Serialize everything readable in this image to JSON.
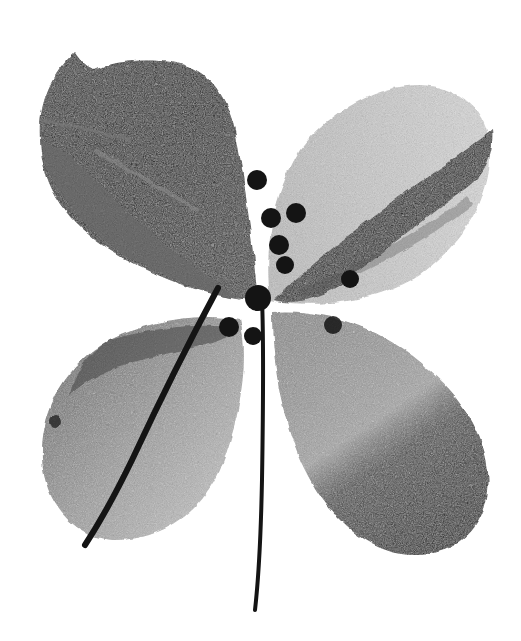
{
  "image": {
    "subject": "Monochrome print of a four-petaled flower with two thin stems and a cluster of dark seed dots at the center",
    "width": 521,
    "height": 641,
    "background": "#ffffff"
  },
  "colors": {
    "ink_dark": "#141414",
    "ink_mid": "#4a4a4a",
    "ink_light": "#9a9a9a",
    "paper": "#ffffff"
  },
  "petals": [
    {
      "name": "upper-left",
      "tone": "dark",
      "cx": 150,
      "cy": 170
    },
    {
      "name": "upper-right",
      "tone": "light with dark diagonal band",
      "cx": 385,
      "cy": 190
    },
    {
      "name": "lower-left",
      "tone": "mottled light-mid",
      "cx": 140,
      "cy": 430
    },
    {
      "name": "lower-right",
      "tone": "light fading to dark tip",
      "cx": 385,
      "cy": 440
    }
  ],
  "stems": [
    {
      "name": "diagonal-stem",
      "from": [
        215,
        290
      ],
      "to": [
        85,
        545
      ]
    },
    {
      "name": "vertical-stem",
      "from": [
        262,
        300
      ],
      "to": [
        255,
        610
      ]
    }
  ],
  "dots": [
    {
      "x": 257,
      "y": 180,
      "r": 10
    },
    {
      "x": 271,
      "y": 218,
      "r": 10
    },
    {
      "x": 296,
      "y": 213,
      "r": 10
    },
    {
      "x": 279,
      "y": 245,
      "r": 10
    },
    {
      "x": 285,
      "y": 265,
      "r": 9
    },
    {
      "x": 350,
      "y": 279,
      "r": 9
    },
    {
      "x": 229,
      "y": 327,
      "r": 10
    },
    {
      "x": 253,
      "y": 336,
      "r": 9
    },
    {
      "x": 333,
      "y": 325,
      "r": 9
    }
  ],
  "caption": "Four-petaled flower print"
}
